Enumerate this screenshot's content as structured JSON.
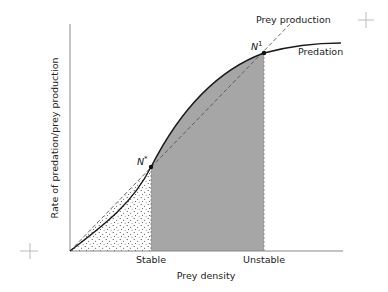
{
  "diagram": {
    "title": "",
    "x_axis": {
      "label": "Prey density",
      "markers": [
        "Stable",
        "Unstable"
      ]
    },
    "y_axis": {
      "label": "Rate of predation/prey production"
    },
    "curves": [
      {
        "name": "Predation",
        "style": "solid",
        "color": "#1a1a1a"
      },
      {
        "name": "Prey production",
        "style": "dashed",
        "color": "#555555"
      }
    ],
    "points": [
      {
        "name": "N",
        "superscript": "*",
        "position": "Stable"
      },
      {
        "name": "N",
        "superscript": "1",
        "position": "Unstable"
      }
    ],
    "regions": [
      {
        "name": "stippled",
        "between": [
          "origin",
          "N*"
        ],
        "color": "#ffffff"
      },
      {
        "name": "shaded",
        "between": [
          "N*",
          "N1"
        ],
        "color": "#a6a6a6"
      }
    ],
    "registration_marks": 2
  },
  "labels": {
    "prey_production": "Prey production",
    "predation": "Predation",
    "n_star_base": "N",
    "n_star_sup": "*",
    "n_one_base": "N",
    "n_one_sup": "1",
    "stable": "Stable",
    "unstable": "Unstable",
    "x_axis": "Prey density",
    "y_axis": "Rate of predation/prey production"
  }
}
